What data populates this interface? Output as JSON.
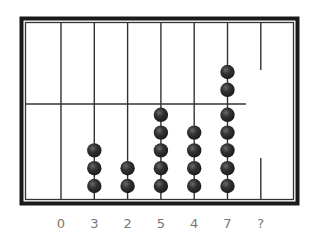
{
  "diagram": {
    "type": "abacus",
    "colors": {
      "frame": "#1a1a1a",
      "rod": "#333333",
      "bead": "#2b2b2b",
      "bead_highlight": "#6a6a6a",
      "label": "#777777"
    },
    "columns": [
      {
        "label": "0",
        "beads_lower": 0,
        "beads_upper": 0,
        "split_rod": false
      },
      {
        "label": "3",
        "beads_lower": 3,
        "beads_upper": 0,
        "split_rod": false
      },
      {
        "label": "2",
        "beads_lower": 2,
        "beads_upper": 0,
        "split_rod": false
      },
      {
        "label": "5",
        "beads_lower": 5,
        "beads_upper": 0,
        "split_rod": false
      },
      {
        "label": "4",
        "beads_lower": 4,
        "beads_upper": 0,
        "split_rod": false
      },
      {
        "label": "7",
        "beads_lower": 5,
        "beads_upper": 2,
        "split_rod": false
      },
      {
        "label": "?",
        "beads_lower": 0,
        "beads_upper": 0,
        "split_rod": true
      }
    ]
  }
}
